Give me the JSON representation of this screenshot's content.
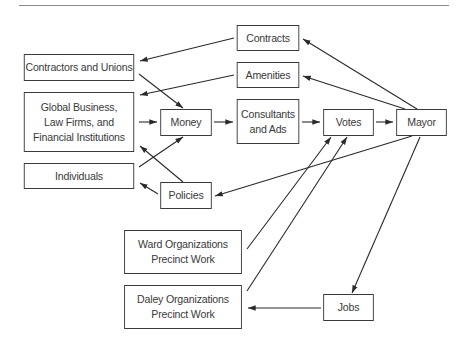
{
  "diagram": {
    "nodes": [
      {
        "id": "contractors",
        "label": "Contractors and Unions",
        "x": 19,
        "y": 54,
        "w": 120,
        "h": 27
      },
      {
        "id": "global",
        "label": "Global Business,\nLaw Firms, and\nFinancial Institutions",
        "x": 19,
        "y": 92,
        "w": 120,
        "h": 60
      },
      {
        "id": "individuals",
        "label": "Individuals",
        "x": 19,
        "y": 163,
        "w": 120,
        "h": 26
      },
      {
        "id": "money",
        "label": "Money",
        "x": 158,
        "y": 109,
        "w": 56,
        "h": 27
      },
      {
        "id": "policies",
        "label": "Policies",
        "x": 158,
        "y": 182,
        "w": 56,
        "h": 27
      },
      {
        "id": "contracts",
        "label": "Contracts",
        "x": 234,
        "y": 25,
        "w": 68,
        "h": 26
      },
      {
        "id": "amenities",
        "label": "Amenities",
        "x": 234,
        "y": 62,
        "w": 68,
        "h": 26
      },
      {
        "id": "consultants",
        "label": "Consultants\nand Ads",
        "x": 234,
        "y": 99,
        "w": 68,
        "h": 45
      },
      {
        "id": "votes",
        "label": "Votes",
        "x": 321,
        "y": 109,
        "w": 55,
        "h": 27
      },
      {
        "id": "mayor",
        "label": "Mayor",
        "x": 394,
        "y": 109,
        "w": 55,
        "h": 27
      },
      {
        "id": "ward",
        "label": "Ward Organizations\nPrecinct Work",
        "x": 119,
        "y": 230,
        "w": 128,
        "h": 44
      },
      {
        "id": "daley",
        "label": "Daley Organizations\nPrecinct Work",
        "x": 119,
        "y": 285,
        "w": 128,
        "h": 44
      },
      {
        "id": "jobs",
        "label": "Jobs",
        "x": 321,
        "y": 294,
        "w": 55,
        "h": 27
      }
    ],
    "edges": [
      {
        "from": "contractors",
        "to": "money",
        "x1": 139,
        "y1": 74,
        "x2": 183,
        "y2": 108
      },
      {
        "from": "global",
        "to": "money",
        "x1": 139,
        "y1": 122,
        "x2": 157,
        "y2": 122
      },
      {
        "from": "individuals",
        "to": "money",
        "x1": 139,
        "y1": 167,
        "x2": 183,
        "y2": 137
      },
      {
        "from": "money",
        "to": "consultants",
        "x1": 214,
        "y1": 122,
        "x2": 233,
        "y2": 122
      },
      {
        "from": "consultants",
        "to": "votes",
        "x1": 302,
        "y1": 122,
        "x2": 320,
        "y2": 122
      },
      {
        "from": "votes",
        "to": "mayor",
        "x1": 376,
        "y1": 122,
        "x2": 393,
        "y2": 122
      },
      {
        "from": "mayor",
        "to": "contracts",
        "x1": 417,
        "y1": 109,
        "x2": 303,
        "y2": 39
      },
      {
        "from": "mayor",
        "to": "amenities",
        "x1": 405,
        "y1": 109,
        "x2": 303,
        "y2": 76
      },
      {
        "from": "contracts",
        "to": "contractors",
        "x1": 234,
        "y1": 38,
        "x2": 140,
        "y2": 61
      },
      {
        "from": "amenities",
        "to": "global",
        "x1": 234,
        "y1": 75,
        "x2": 140,
        "y2": 95
      },
      {
        "from": "mayor",
        "to": "policies",
        "x1": 412,
        "y1": 136,
        "x2": 215,
        "y2": 196
      },
      {
        "from": "policies",
        "to": "individuals",
        "x1": 158,
        "y1": 194,
        "x2": 140,
        "y2": 183
      },
      {
        "from": "policies",
        "to": "global",
        "x1": 183,
        "y1": 182,
        "x2": 140,
        "y2": 146
      },
      {
        "from": "ward",
        "to": "votes",
        "x1": 247,
        "y1": 249,
        "x2": 331,
        "y2": 137
      },
      {
        "from": "daley",
        "to": "votes",
        "x1": 247,
        "y1": 291,
        "x2": 347,
        "y2": 137
      },
      {
        "from": "mayor",
        "to": "jobs",
        "x1": 420,
        "y1": 137,
        "x2": 352,
        "y2": 293
      },
      {
        "from": "jobs",
        "to": "daley",
        "x1": 321,
        "y1": 308,
        "x2": 248,
        "y2": 308
      }
    ]
  }
}
